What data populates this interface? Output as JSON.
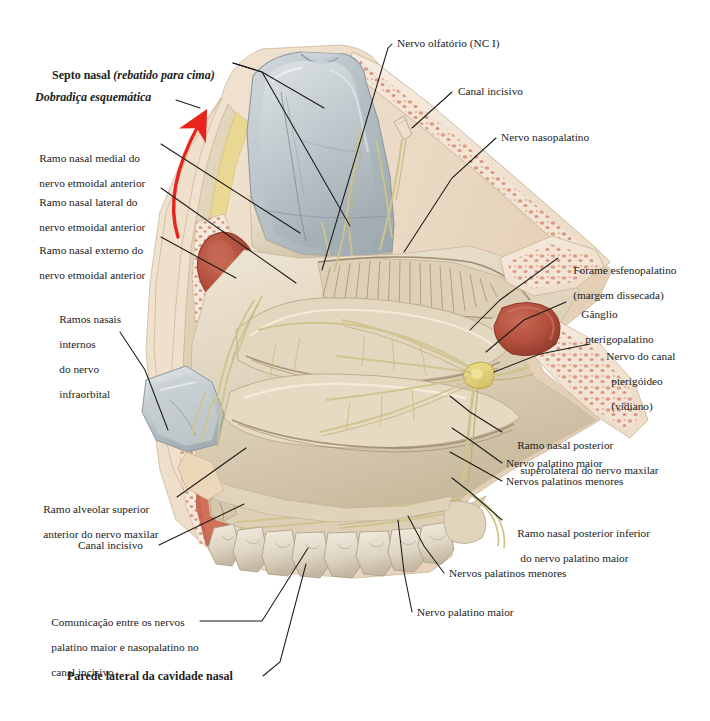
{
  "figure": {
    "title_bottom": "Parede lateral da cavidade nasal",
    "type": "anatomical-illustration",
    "palette": {
      "bone_light": "#e6d9c3",
      "bone_mid": "#d8c7a8",
      "mucosa_tan": "#ddd0b6",
      "cartilage_gray": "#b9c2c6",
      "cartilage_gray_dark": "#97a3a9",
      "marrow_pink": "#e8a48f",
      "marrow_speck": "#cf7a63",
      "vessel_red": "#b85442",
      "fat_yellow": "#ead98a",
      "nerve_yellow": "#d8cf96",
      "arrow_red": "#e8251c",
      "line_black": "#1a1a1a",
      "skin_beige": "#efe0cd"
    }
  },
  "labels": {
    "left": [
      {
        "id": "septo-nasal",
        "text": "Septo nasal (rebatido para cima)",
        "style": "bold-mixed-italic"
      },
      {
        "id": "dobradica",
        "text": "Dobradiça esquemática",
        "style": "bold-italic"
      },
      {
        "id": "ramo-nasal-medial",
        "line1": "Ramo nasal medial do",
        "line2": "nervo etmoidal anterior"
      },
      {
        "id": "ramo-nasal-lateral",
        "line1": "Ramo nasal lateral do",
        "line2": "nervo etmoidal anterior"
      },
      {
        "id": "ramo-nasal-externo",
        "line1": "Ramo nasal externo do",
        "line2": "nervo etmoidal anterior"
      },
      {
        "id": "ramos-nasais-internos",
        "line1": "Ramos nasais",
        "line2": "internos",
        "line3": "do nervo",
        "line4": "infraorbital"
      },
      {
        "id": "ramo-alveolar-superior",
        "line1": "Ramo alveolar superior",
        "line2": "anterior do nervo maxilar"
      },
      {
        "id": "canal-incisivo-left",
        "text": "Canal incisivo"
      },
      {
        "id": "comunicacao-nervos",
        "line1": "Comunicação entre os nervos",
        "line2": "palatino maior e nasopalatino no",
        "line3": "canal incisivo"
      }
    ],
    "right": [
      {
        "id": "nervo-olfatorio",
        "text": "Nervo olfatório (NC I)"
      },
      {
        "id": "canal-incisivo-top",
        "text": "Canal incisivo"
      },
      {
        "id": "nervo-nasopalatino",
        "text": "Nervo nasopalatino"
      },
      {
        "id": "forame-esfenopalatino",
        "line1": "Forame esfenopalatino",
        "line2": "(margem dissecada)",
        "line2_italic": true
      },
      {
        "id": "ganglio-pterigopalatino",
        "line1": "Gânglio",
        "line2": "pterigopalatino"
      },
      {
        "id": "nervo-canal-pterigoideo",
        "line1": "Nervo do canal",
        "line2": "pterigóideo",
        "line3": "(vidiano)"
      },
      {
        "id": "ramo-nasal-post-sup",
        "line1": "Ramo nasal posterior",
        "line2": "superolateral do nervo maxilar"
      },
      {
        "id": "nervo-palatino-maior-r",
        "text": "Nervo palatino maior"
      },
      {
        "id": "nervos-palatinos-menores-r",
        "text": "Nervos palatinos menores"
      },
      {
        "id": "ramo-nasal-post-inf",
        "line1": "Ramo nasal posterior inferior",
        "line2": "do nervo palatino maior"
      },
      {
        "id": "nervos-palatinos-menores-b",
        "text": "Nervos palatinos menores"
      },
      {
        "id": "nervo-palatino-maior-b",
        "text": "Nervo palatino maior"
      }
    ],
    "bottom": [
      {
        "id": "parede-lateral",
        "text": "Parede lateral da cavidade nasal",
        "style": "bold"
      }
    ]
  },
  "annotations": {
    "arrow": {
      "name": "hinge-rotation-arrow",
      "color": "#e8251c",
      "direction": "upward-curved"
    }
  }
}
